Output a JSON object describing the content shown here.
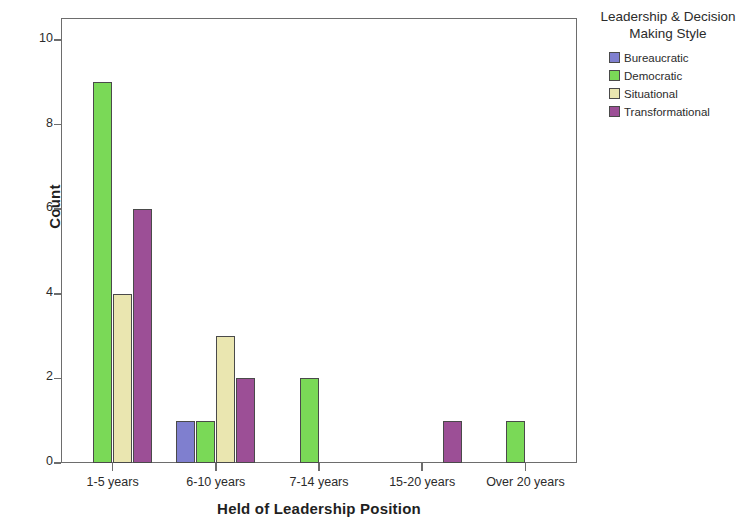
{
  "chart_data": {
    "type": "bar",
    "title": "",
    "xlabel": "Held of Leadership Position",
    "ylabel": "Count",
    "categories": [
      "1-5 years",
      "6-10 years",
      "7-14 years",
      "15-20 years",
      "Over 20 years"
    ],
    "series": [
      {
        "name": "Bureaucratic",
        "color": "#7f7fcf",
        "values": [
          0,
          1,
          0,
          0,
          0
        ]
      },
      {
        "name": "Democratic",
        "color": "#7ad957",
        "values": [
          9,
          1,
          2,
          0,
          1
        ]
      },
      {
        "name": "Situational",
        "color": "#eae6b0",
        "values": [
          4,
          3,
          0,
          0,
          0
        ]
      },
      {
        "name": "Transformational",
        "color": "#9c4f96",
        "values": [
          6,
          2,
          0,
          1,
          0
        ]
      }
    ],
    "ylim": [
      0,
      10.5
    ],
    "yticks": [
      0,
      2,
      4,
      6,
      8,
      10
    ],
    "ytick_labels": [
      "0",
      "2",
      "4",
      "6",
      "8",
      "10"
    ],
    "grid": false,
    "legend_position": "right"
  },
  "legend": {
    "title_line1": "Leadership & Decision",
    "title_line2": "Making Style"
  }
}
